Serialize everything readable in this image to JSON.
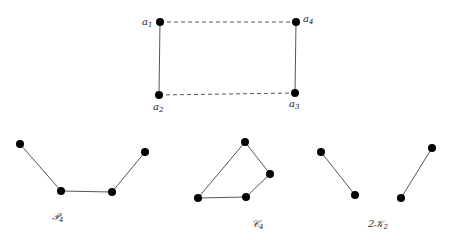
{
  "figure": {
    "top_graph": {
      "vertices": [
        {
          "id": "a1",
          "label": "a",
          "sub": "1",
          "x": 160,
          "y": 22,
          "lx": 142,
          "ly": 25
        },
        {
          "id": "a4",
          "label": "a",
          "sub": "4",
          "x": 296,
          "y": 22,
          "lx": 303,
          "ly": 22
        },
        {
          "id": "a2",
          "label": "a",
          "sub": "2",
          "x": 159,
          "y": 95,
          "lx": 153,
          "ly": 110
        },
        {
          "id": "a3",
          "label": "a",
          "sub": "3",
          "x": 295,
          "y": 93,
          "lx": 289,
          "ly": 107
        }
      ],
      "solid_edges": [
        [
          "a1",
          "a2"
        ],
        [
          "a4",
          "a3"
        ]
      ],
      "dashed_edges": [
        [
          "a1",
          "a4"
        ],
        [
          "a2",
          "a3"
        ]
      ]
    },
    "bottom_graphs": [
      {
        "name": "P4",
        "caption": "𝒫",
        "caption_sub": "4",
        "cx": 62,
        "cy": 220,
        "points": [
          [
            20,
            144
          ],
          [
            61,
            191
          ],
          [
            112,
            192
          ],
          [
            145,
            152
          ]
        ],
        "edges": [
          [
            0,
            1
          ],
          [
            1,
            2
          ],
          [
            2,
            3
          ]
        ]
      },
      {
        "name": "C4",
        "caption": "𝒞",
        "caption_sub": "4",
        "cx": 262,
        "cy": 227,
        "points": [
          [
            245,
            142
          ],
          [
            270,
            174
          ],
          [
            246,
            197
          ],
          [
            198,
            198
          ]
        ],
        "edges": [
          [
            0,
            1
          ],
          [
            1,
            2
          ],
          [
            2,
            3
          ],
          [
            3,
            0
          ]
        ]
      },
      {
        "name": "2K2",
        "caption": "2𝒦",
        "caption_sub": "2",
        "cx": 378,
        "cy": 227,
        "points": [
          [
            321,
            152
          ],
          [
            355,
            195
          ],
          [
            401,
            198
          ],
          [
            432,
            148
          ]
        ],
        "edges": [
          [
            0,
            1
          ],
          [
            2,
            3
          ]
        ]
      }
    ],
    "colors": {
      "vertex": "#000000",
      "edge": "#555555",
      "dashed": "#555555"
    }
  }
}
